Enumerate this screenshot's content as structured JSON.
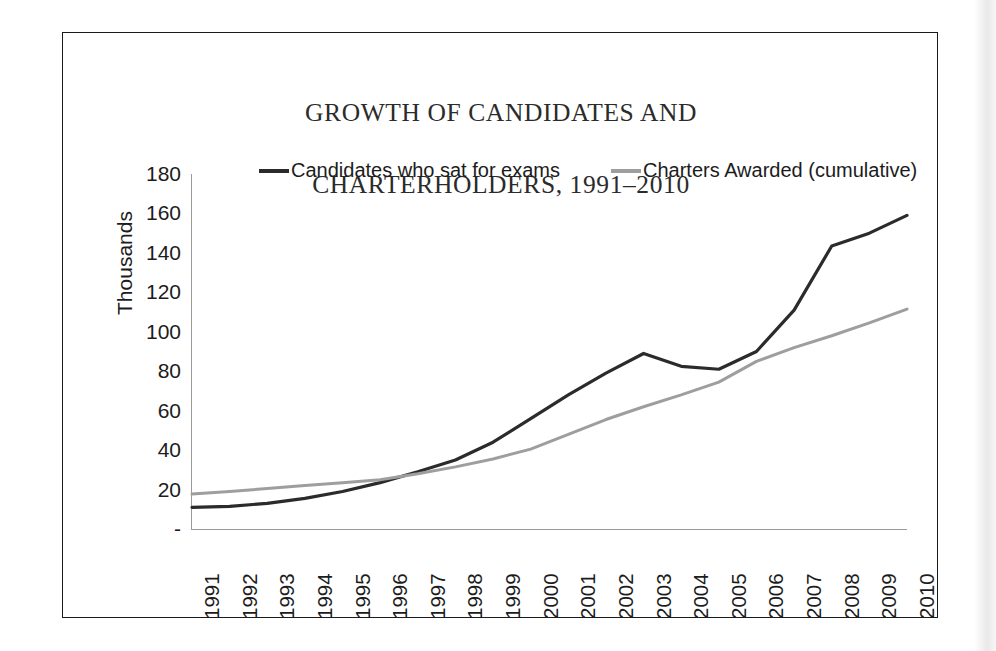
{
  "figure": {
    "title_line1": "GROWTH OF CANDIDATES AND",
    "title_line2": "CHARTERHOLDERS, 1991–2010"
  },
  "chart_data": {
    "type": "line",
    "xlabel": "",
    "ylabel": "Thousands",
    "x": [
      1991,
      1992,
      1993,
      1994,
      1995,
      1996,
      1997,
      1998,
      1999,
      2000,
      2001,
      2002,
      2003,
      2004,
      2005,
      2006,
      2007,
      2008,
      2009,
      2010
    ],
    "categories": [
      "1991",
      "1992",
      "1993",
      "1994",
      "1995",
      "1996",
      "1997",
      "1998",
      "1999",
      "2000",
      "2001",
      "2002",
      "2003",
      "2004",
      "2005",
      "2006",
      "2007",
      "2008",
      "2009",
      "2010"
    ],
    "series": [
      {
        "name": "Candidates who sat for exams",
        "color": "#2b2b2b",
        "values": [
          11,
          11.5,
          13,
          15.5,
          19,
          23.5,
          29,
          35,
          44,
          56,
          68,
          79,
          89,
          82.5,
          81,
          90,
          111,
          143.5,
          150,
          159
        ]
      },
      {
        "name": "Charters Awarded (cumulative)",
        "color": "#9e9e9e",
        "values": [
          17.7,
          19,
          20.5,
          22,
          23.5,
          25,
          28,
          31.5,
          35.5,
          40.5,
          48,
          55.5,
          62,
          68,
          74.5,
          85,
          92,
          98,
          104.5,
          111.5
        ]
      }
    ],
    "ylim": [
      0,
      180
    ],
    "yticks": [
      0,
      20,
      40,
      60,
      80,
      100,
      120,
      140,
      160,
      180
    ],
    "ytick_labels": [
      "-",
      "20",
      "40",
      "60",
      "80",
      "100",
      "120",
      "140",
      "160",
      "180"
    ],
    "grid": false,
    "legend_position": "top"
  }
}
